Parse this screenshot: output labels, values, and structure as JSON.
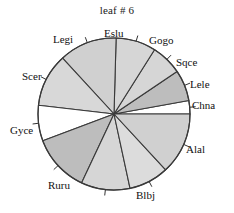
{
  "chart_data": {
    "type": "pie",
    "title": "leaf # 6",
    "xlabel": "",
    "ylabel": "",
    "legend_position": "none",
    "grid": false,
    "labels_position": "outside-with-leader-ticks",
    "start_angle_deg": 0,
    "direction": "counterclockwise",
    "categories": [
      "Chna",
      "Lele",
      "Sqce",
      "Gogo",
      "Eslu",
      "Legi",
      "Scer",
      "Gyce",
      "Ruru",
      "Blbj",
      "Alal"
    ],
    "values": [
      3,
      7,
      7,
      9,
      13,
      12,
      8,
      13,
      11,
      9,
      16
    ],
    "slices": [
      {
        "label": "Chna",
        "value": 3,
        "percent": 2.8,
        "start_deg": 0,
        "end_deg": 10.2,
        "color": "#ffffff"
      },
      {
        "label": "Lele",
        "value": 7,
        "percent": 6.5,
        "start_deg": 10.2,
        "end_deg": 34.0,
        "color": "#bdbdbd"
      },
      {
        "label": "Sqce",
        "value": 7,
        "percent": 6.5,
        "start_deg": 34.0,
        "end_deg": 57.8,
        "color": "#d6d6d6"
      },
      {
        "label": "Gogo",
        "value": 9,
        "percent": 8.4,
        "start_deg": 57.8,
        "end_deg": 88.4,
        "color": "#d6d6d6"
      },
      {
        "label": "Eslu",
        "value": 13,
        "percent": 12.1,
        "start_deg": 88.4,
        "end_deg": 132.6,
        "color": "#d0d0d0"
      },
      {
        "label": "Legi",
        "value": 12,
        "percent": 11.2,
        "start_deg": 132.6,
        "end_deg": 173.4,
        "color": "#d8d8d8"
      },
      {
        "label": "Scer",
        "value": 8,
        "percent": 7.5,
        "start_deg": 173.4,
        "end_deg": 200.6,
        "color": "#ffffff"
      },
      {
        "label": "Gyce",
        "value": 13,
        "percent": 12.1,
        "start_deg": 200.6,
        "end_deg": 244.8,
        "color": "#bdbdbd"
      },
      {
        "label": "Ruru",
        "value": 11,
        "percent": 10.3,
        "start_deg": 244.8,
        "end_deg": 282.2,
        "color": "#d6d6d6"
      },
      {
        "label": "Blbj",
        "value": 9,
        "percent": 8.4,
        "start_deg": 282.2,
        "end_deg": 312.8,
        "color": "#dcdcdc"
      },
      {
        "label": "Alal",
        "value": 16,
        "percent": 15.0,
        "start_deg": 312.8,
        "end_deg": 360.0,
        "color": "#d0d0d0"
      }
    ],
    "total": 108,
    "geometry": {
      "center_x": 114,
      "center_y": 114,
      "radius": 76,
      "outline_color": "#3a3a3a",
      "background": "#ffffff"
    }
  },
  "labels": {
    "eslu": "Eslu",
    "gogo": "Gogo",
    "sqce": "Sqce",
    "lele": "Lele",
    "chna": "Chna",
    "alal": "Alal",
    "blbj": "Blbj",
    "ruru": "Ruru",
    "gyce": "Gyce",
    "scer": "Scer",
    "legi": "Legi"
  }
}
